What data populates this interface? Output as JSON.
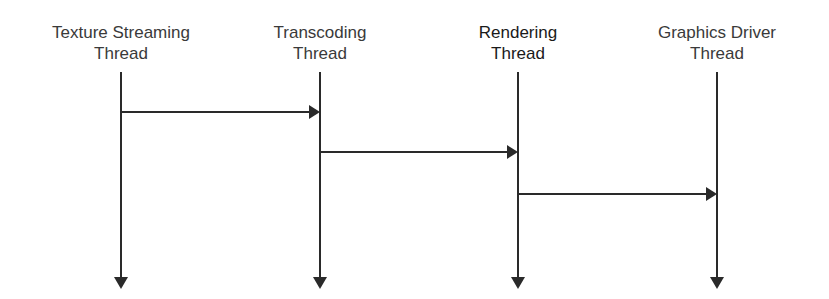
{
  "diagram": {
    "type": "sequence",
    "lanes": [
      {
        "id": "texture",
        "line1": "Texture Streaming",
        "line2": "Thread",
        "x": 121
      },
      {
        "id": "transcoding",
        "line1": "Transcoding",
        "line2": "Thread",
        "x": 320
      },
      {
        "id": "rendering",
        "line1": "Rendering",
        "line2": "Thread",
        "x": 518
      },
      {
        "id": "driver",
        "line1": "Graphics Driver",
        "line2": "Thread",
        "x": 717
      }
    ],
    "messages": [
      {
        "from": "texture",
        "to": "transcoding",
        "y": 112
      },
      {
        "from": "transcoding",
        "to": "rendering",
        "y": 152
      },
      {
        "from": "rendering",
        "to": "driver",
        "y": 194
      }
    ],
    "colors": {
      "line": "#2a2a2a",
      "text": "#3a3a3a"
    }
  }
}
